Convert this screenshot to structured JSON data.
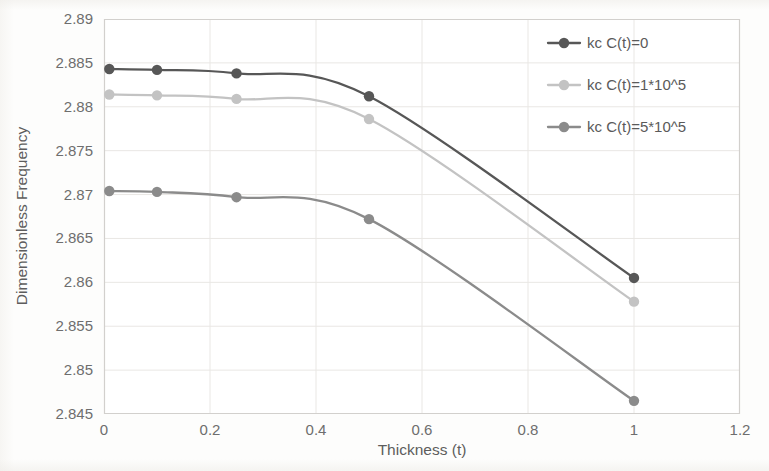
{
  "chart_data": {
    "type": "line",
    "title": "",
    "xlabel": "Thickness (t)",
    "ylabel": "Dimensionless Frequency",
    "x": [
      0.01,
      0.1,
      0.25,
      0.5,
      1.0
    ],
    "xlim": [
      0,
      1.2
    ],
    "ylim": [
      2.845,
      2.89
    ],
    "xticks": [
      "0",
      "0.2",
      "0.4",
      "0.6",
      "0.8",
      "1",
      "1.2"
    ],
    "xtick_values": [
      0,
      0.2,
      0.4,
      0.6,
      0.8,
      1,
      1.2
    ],
    "yticks": [
      "2.845",
      "2.85",
      "2.855",
      "2.86",
      "2.865",
      "2.87",
      "2.875",
      "2.88",
      "2.885",
      "2.89"
    ],
    "ytick_values": [
      2.845,
      2.85,
      2.855,
      2.86,
      2.865,
      2.87,
      2.875,
      2.88,
      2.885,
      2.89
    ],
    "grid": true,
    "legend_position": "top-right",
    "series": [
      {
        "name": "kc C(t)=0",
        "color": "#575757",
        "marker": "circle",
        "values": [
          2.8843,
          2.8842,
          2.8838,
          2.8812,
          2.8605
        ]
      },
      {
        "name": "kc C(t)=1*10^5",
        "color": "#c3c3c3",
        "marker": "circle",
        "values": [
          2.8814,
          2.8813,
          2.8809,
          2.8786,
          2.8578
        ]
      },
      {
        "name": "kc C(t)=5*10^5",
        "color": "#8b8b8b",
        "marker": "circle",
        "values": [
          2.8704,
          2.8703,
          2.8697,
          2.8672,
          2.8465
        ]
      }
    ]
  },
  "legend": {
    "entries": [
      {
        "label": "kc C(t)=0"
      },
      {
        "label": "kc C(t)=1*10^5"
      },
      {
        "label": "kc C(t)=5*10^5"
      }
    ]
  },
  "axes": {
    "x_title": "Thickness (t)",
    "y_title": "Dimensionless Frequency"
  }
}
